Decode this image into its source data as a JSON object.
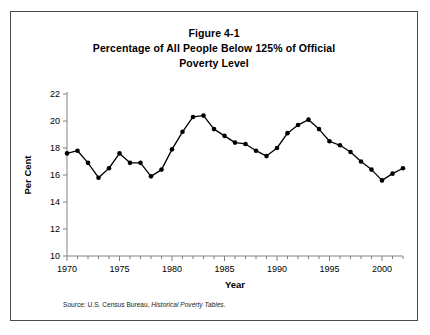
{
  "figure": {
    "title_lines": [
      "Figure 4-1",
      "Percentage of All People Below 125% of Official",
      "Poverty Level"
    ],
    "source_prefix": "Source: U.S. Census Bureau,",
    "source_italic": "Historical Poverty Tables",
    "source_suffix": "."
  },
  "chart_data": {
    "type": "line",
    "title": "Figure 4-1 Percentage of All People Below 125% of Official Poverty Level",
    "xlabel": "Year",
    "ylabel": "Per Cent",
    "xlim": [
      1970,
      2002
    ],
    "ylim": [
      10,
      22
    ],
    "ytick_step": 2,
    "yticks": [
      10,
      12,
      14,
      16,
      18,
      20,
      22
    ],
    "xticks_labeled": [
      1970,
      1975,
      1980,
      1985,
      1990,
      1995,
      2000
    ],
    "xtick_minor_step": 1,
    "grid": false,
    "legend": null,
    "marker": "filled-circle",
    "line_color": "#000000",
    "x": [
      1970,
      1971,
      1972,
      1973,
      1974,
      1975,
      1976,
      1977,
      1978,
      1979,
      1980,
      1981,
      1982,
      1983,
      1984,
      1985,
      1986,
      1987,
      1988,
      1989,
      1990,
      1991,
      1992,
      1993,
      1994,
      1995,
      1996,
      1997,
      1998,
      1999,
      2000,
      2001,
      2002
    ],
    "values": [
      17.6,
      17.8,
      16.9,
      15.8,
      16.5,
      17.6,
      16.9,
      16.9,
      15.9,
      16.4,
      17.9,
      19.2,
      20.3,
      20.4,
      19.4,
      18.9,
      18.4,
      18.3,
      17.8,
      17.4,
      18.0,
      19.1,
      19.7,
      20.1,
      19.4,
      18.5,
      18.2,
      17.7,
      17.0,
      16.4,
      15.6,
      16.1,
      16.5
    ]
  }
}
